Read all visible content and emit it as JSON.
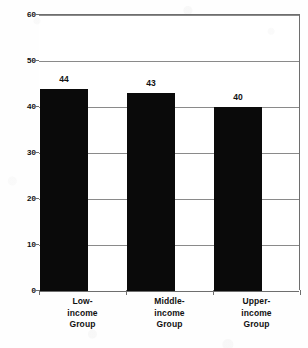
{
  "chart_data": {
    "type": "bar",
    "title": "",
    "xlabel": "",
    "ylabel": "Average Percentage of Minutes",
    "categories": [
      "Low-income Group",
      "Middle-income Group",
      "Upper-income Group"
    ],
    "category_lines": [
      [
        "Low-",
        "income",
        "Group"
      ],
      [
        "Middle-",
        "income",
        "Group"
      ],
      [
        "Upper-",
        "income",
        "Group"
      ]
    ],
    "values": [
      44,
      43,
      40
    ],
    "data_labels": [
      "44",
      "43",
      "40"
    ],
    "ylim": [
      0,
      60
    ],
    "ytick_values": [
      0,
      10,
      20,
      30,
      40,
      50,
      60
    ],
    "yticks": [
      "0",
      "10",
      "20",
      "30",
      "40",
      "50",
      "60"
    ],
    "grid": true,
    "legend": false,
    "legend_position": "none",
    "bar_color": "#0a0a0a",
    "gridline_color": "#8a8a8a",
    "axis_color": "#6e6e6e",
    "background_color": "#ffffff"
  }
}
